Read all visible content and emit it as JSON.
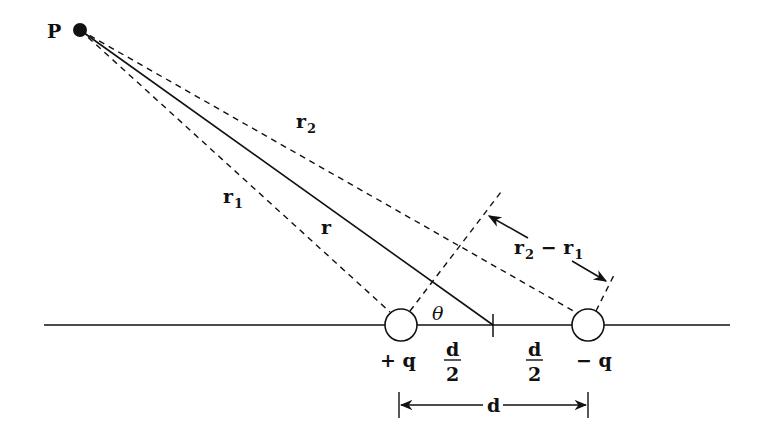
{
  "diagram": {
    "labels": {
      "point": "P",
      "r": "r",
      "r1": "r",
      "r1_sub": "1",
      "r2": "r",
      "r2_sub": "2",
      "diff_r2": "r",
      "diff_r2_sub": "2",
      "diff_minus": " − ",
      "diff_r1": "r",
      "diff_r1_sub": "1",
      "theta": "θ",
      "plus_charge": "+ q",
      "minus_charge": "− q",
      "half_d_left_num": "d",
      "half_d_left_den": "2",
      "half_d_right_num": "d",
      "half_d_right_den": "2",
      "separation": "d"
    },
    "colors": {
      "ink": "#111111",
      "background": "#ffffff"
    }
  }
}
